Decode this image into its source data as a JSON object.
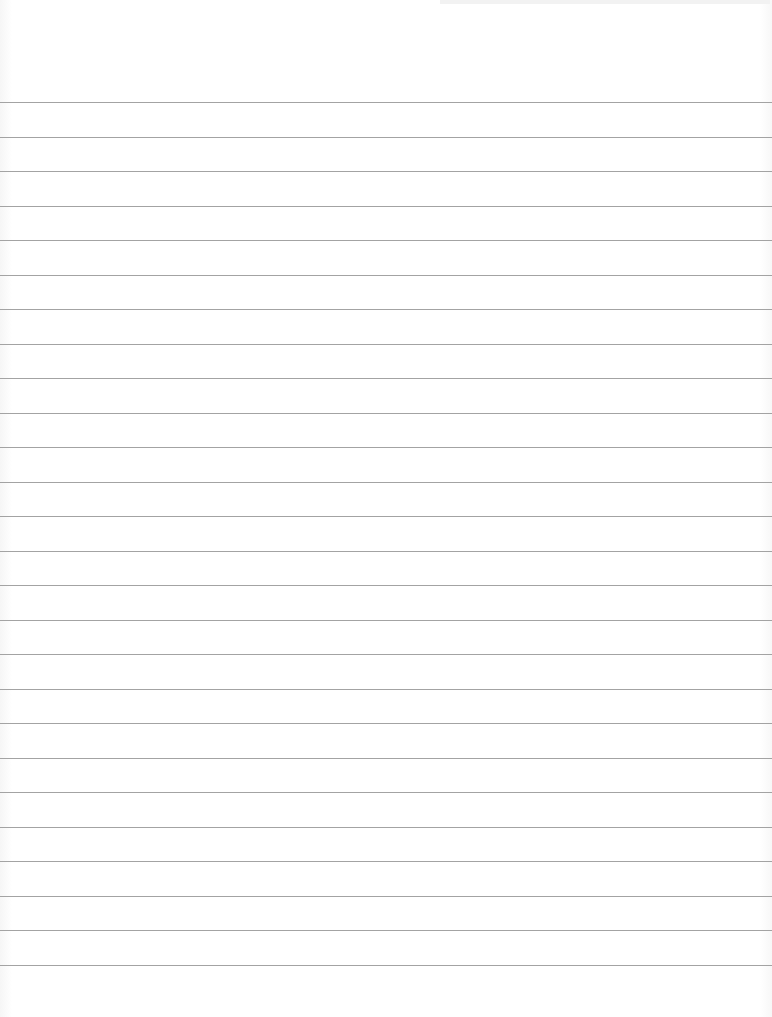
{
  "page": {
    "type": "lined-paper",
    "background_color": "#fdfdfd",
    "rule_color": "#a3a3a3",
    "rule_count": 26,
    "first_rule_y": 102,
    "rule_spacing_px": 34.5
  }
}
